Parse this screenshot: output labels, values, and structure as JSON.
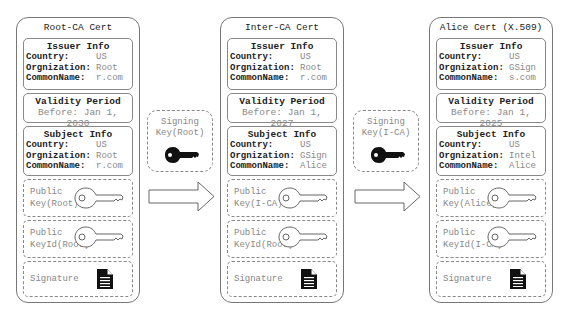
{
  "certs": [
    {
      "title": "Root-CA Cert",
      "issuer": {
        "title": "Issuer Info",
        "country_label": "Country:",
        "country": "US",
        "org_label": "Orgnization:",
        "org": "Root",
        "cn_label": "CommonName:",
        "cn": "r.com"
      },
      "validity": {
        "title": "Validity Period",
        "value": "Before: Jan 1, 2030"
      },
      "subject": {
        "title": "Subject Info",
        "country_label": "Country:",
        "country": "US",
        "org_label": "Orgnization:",
        "org": "Root",
        "cn_label": "CommonName:",
        "cn": "r.com"
      },
      "public_key": {
        "line1": "Public",
        "line2": "Key(Root)",
        "icon": "key-outline-icon"
      },
      "key_id": {
        "line1": "Public",
        "line2": "KeyId(Root)",
        "icon": "key-outline-icon"
      },
      "signature": {
        "label": "Signature",
        "icon": "document-icon"
      }
    },
    {
      "title": "Inter-CA Cert",
      "issuer": {
        "title": "Issuer Info",
        "country_label": "Country:",
        "country": "US",
        "org_label": "Orgnization:",
        "org": "Root",
        "cn_label": "CommonName:",
        "cn": "r.com"
      },
      "validity": {
        "title": "Validity Period",
        "value": "Before: Jan 1, 2027"
      },
      "subject": {
        "title": "Subject Info",
        "country_label": "Country:",
        "country": "US",
        "org_label": "Orgnization:",
        "org": "GSign",
        "cn_label": "CommonName:",
        "cn": "Alice"
      },
      "public_key": {
        "line1": "Public",
        "line2": "Key(I-CA)",
        "icon": "key-outline-icon"
      },
      "key_id": {
        "line1": "Public",
        "line2": "KeyId(Root)",
        "icon": "key-outline-icon"
      },
      "signature": {
        "label": "Signature",
        "icon": "document-icon"
      }
    },
    {
      "title": "Alice Cert (X.509)",
      "issuer": {
        "title": "Issuer Info",
        "country_label": "Country:",
        "country": "US",
        "org_label": "Orgnization:",
        "org": "GSign",
        "cn_label": "CommonName:",
        "cn": "s.com"
      },
      "validity": {
        "title": "Validity Period",
        "value": "Before: Jan 1, 2025"
      },
      "subject": {
        "title": "Subject Info",
        "country_label": "Country:",
        "country": "US",
        "org_label": "Orgnization:",
        "org": "Intel",
        "cn_label": "CommonName:",
        "cn": "Alice"
      },
      "public_key": {
        "line1": "Public",
        "line2": "Key(Alice)",
        "icon": "key-outline-icon"
      },
      "key_id": {
        "line1": "Public",
        "line2": "KeyId(I-CA)",
        "icon": "key-outline-icon"
      },
      "signature": {
        "label": "Signature",
        "icon": "document-icon"
      }
    }
  ],
  "signers": [
    {
      "line1": "Signing",
      "line2": "Key(Root)",
      "icon": "key-solid-icon"
    },
    {
      "line1": "Signing",
      "line2": "Key(I-CA)",
      "icon": "key-solid-icon"
    }
  ],
  "arrows": [
    {
      "icon": "right-arrow-icon"
    },
    {
      "icon": "right-arrow-icon"
    }
  ],
  "colors": {
    "border": "#777777",
    "muted_text": "#888888",
    "text": "#222222",
    "key_fill": "#111111"
  }
}
